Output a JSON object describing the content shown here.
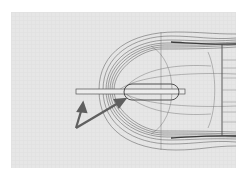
{
  "viewport": {
    "background": "#e6e6e6",
    "grid_color": "#d9d9d9",
    "wire_color": "#6a6a6a",
    "dark_wire_color": "#3c3c3c",
    "arrow_color": "#5f5f5f"
  },
  "annotations": {
    "arrows": [
      {
        "from": [
          65,
          116
        ],
        "to": [
          72,
          93
        ],
        "target": "rod-end"
      },
      {
        "from": [
          65,
          116
        ],
        "to": [
          113,
          88
        ],
        "target": "slot"
      }
    ]
  }
}
